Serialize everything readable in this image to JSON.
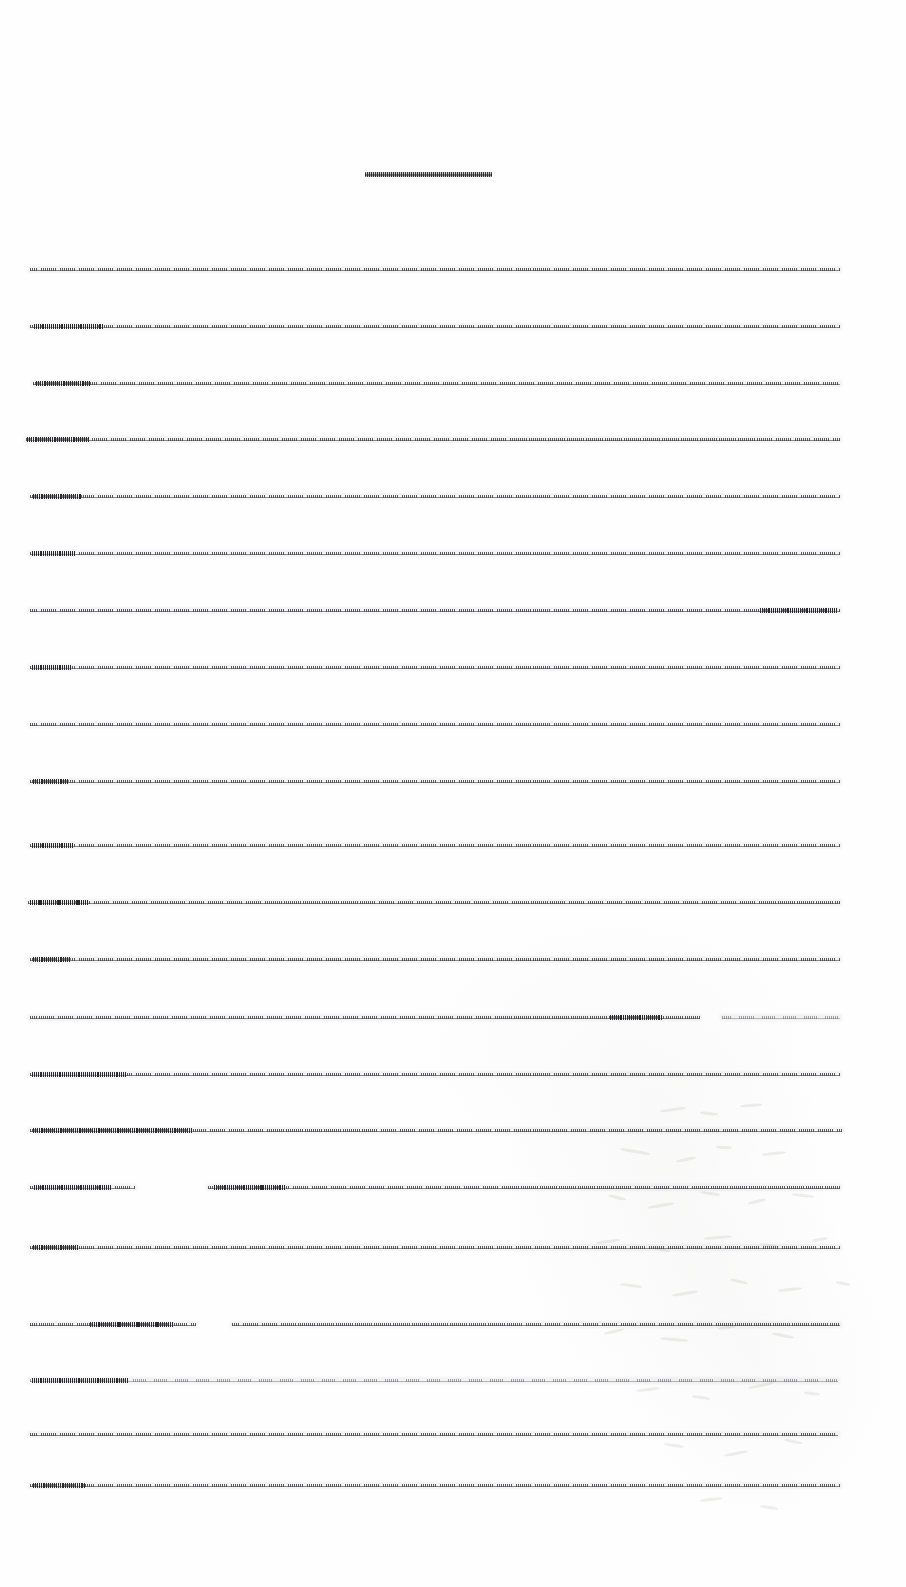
{
  "document": {
    "kind": "scanned-text-page",
    "page_width": 906,
    "page_height": 1587,
    "background_color": "#fefefe",
    "ink_color": "#37373a",
    "legibility": "text is rendered at a scale where individual glyphs are not resolvable; each text line appears as a compressed horizontal stroke",
    "text_block": {
      "left_margin": 30,
      "right_margin": 840,
      "column_width": 810,
      "line_spacing": 57.2,
      "first_line_y": 267,
      "line_count": 23
    }
  },
  "title": {
    "name": "document-title",
    "x": 365,
    "y": 172,
    "width": 127,
    "height": 5,
    "center_x": 428.5,
    "weight": "bold",
    "text": ""
  },
  "lines": [
    {
      "y": 267,
      "segments": [
        {
          "x": 30,
          "w": 810,
          "density": "normal"
        }
      ],
      "bumps": []
    },
    {
      "y": 324,
      "segments": [
        {
          "x": 30,
          "w": 810,
          "density": "normal"
        }
      ],
      "bumps": [
        {
          "x": 34,
          "w": 70
        }
      ]
    },
    {
      "y": 381,
      "segments": [
        {
          "x": 33,
          "w": 807,
          "density": "normal"
        }
      ],
      "bumps": [
        {
          "x": 36,
          "w": 54
        }
      ]
    },
    {
      "y": 437,
      "segments": [
        {
          "x": 26,
          "w": 814,
          "density": "normal"
        }
      ],
      "bumps": [
        {
          "x": 27,
          "w": 62
        }
      ]
    },
    {
      "y": 494,
      "segments": [
        {
          "x": 30,
          "w": 810,
          "density": "normal"
        }
      ],
      "bumps": [
        {
          "x": 33,
          "w": 48
        }
      ]
    },
    {
      "y": 551,
      "segments": [
        {
          "x": 30,
          "w": 810,
          "density": "normal"
        }
      ],
      "bumps": [
        {
          "x": 32,
          "w": 44
        }
      ]
    },
    {
      "y": 608,
      "segments": [
        {
          "x": 30,
          "w": 810,
          "density": "normal"
        }
      ],
      "bumps": [
        {
          "x": 760,
          "w": 78
        }
      ]
    },
    {
      "y": 665,
      "segments": [
        {
          "x": 30,
          "w": 810,
          "density": "normal"
        }
      ],
      "bumps": [
        {
          "x": 32,
          "w": 40
        }
      ]
    },
    {
      "y": 722,
      "segments": [
        {
          "x": 30,
          "w": 810,
          "density": "normal"
        }
      ],
      "bumps": []
    },
    {
      "y": 779,
      "segments": [
        {
          "x": 30,
          "w": 810,
          "density": "normal"
        }
      ],
      "bumps": [
        {
          "x": 33,
          "w": 36
        }
      ]
    },
    {
      "y": 843,
      "segments": [
        {
          "x": 30,
          "w": 810,
          "density": "normal"
        }
      ],
      "bumps": [
        {
          "x": 32,
          "w": 42
        }
      ]
    },
    {
      "y": 900,
      "segments": [
        {
          "x": 28,
          "w": 812,
          "density": "normal"
        }
      ],
      "bumps": [
        {
          "x": 30,
          "w": 58
        }
      ]
    },
    {
      "y": 957,
      "segments": [
        {
          "x": 30,
          "w": 810,
          "density": "normal"
        }
      ],
      "bumps": [
        {
          "x": 33,
          "w": 38
        }
      ]
    },
    {
      "y": 1015,
      "segments": [
        {
          "x": 30,
          "w": 670,
          "density": "normal"
        },
        {
          "x": 722,
          "w": 118,
          "density": "light"
        }
      ],
      "bumps": [
        {
          "x": 610,
          "w": 52
        }
      ]
    },
    {
      "y": 1072,
      "segments": [
        {
          "x": 30,
          "w": 810,
          "density": "normal"
        }
      ],
      "bumps": [
        {
          "x": 32,
          "w": 94
        }
      ]
    },
    {
      "y": 1128,
      "segments": [
        {
          "x": 30,
          "w": 812,
          "density": "normal"
        }
      ],
      "bumps": [
        {
          "x": 33,
          "w": 160
        }
      ]
    },
    {
      "y": 1185,
      "segments": [
        {
          "x": 30,
          "w": 105,
          "density": "normal"
        },
        {
          "x": 208,
          "w": 632,
          "density": "normal"
        }
      ],
      "bumps": [
        {
          "x": 34,
          "w": 78
        },
        {
          "x": 214,
          "w": 72
        }
      ]
    },
    {
      "y": 1245,
      "segments": [
        {
          "x": 30,
          "w": 810,
          "density": "normal"
        }
      ],
      "bumps": [
        {
          "x": 33,
          "w": 46
        }
      ]
    },
    {
      "y": 1322,
      "segments": [
        {
          "x": 30,
          "w": 166,
          "density": "normal"
        },
        {
          "x": 232,
          "w": 608,
          "density": "normal"
        }
      ],
      "bumps": [
        {
          "x": 90,
          "w": 84
        }
      ]
    },
    {
      "y": 1378,
      "segments": [
        {
          "x": 30,
          "w": 808,
          "density": "light"
        }
      ],
      "bumps": [
        {
          "x": 32,
          "w": 96
        }
      ]
    },
    {
      "y": 1432,
      "segments": [
        {
          "x": 30,
          "w": 808,
          "density": "normal"
        }
      ],
      "bumps": []
    },
    {
      "y": 1483,
      "segments": [
        {
          "x": 30,
          "w": 810,
          "density": "normal"
        }
      ],
      "bumps": [
        {
          "x": 33,
          "w": 52
        }
      ]
    }
  ],
  "artifacts": {
    "name": "scan-showthrough",
    "description": "faint ghosted text bleeding through from the reverse side of the sheet, concentrated in the lower-right quadrant",
    "strokes": [
      {
        "x": 660,
        "y": 1108,
        "w": 26,
        "h": 3,
        "r": -8
      },
      {
        "x": 700,
        "y": 1112,
        "w": 18,
        "h": 3,
        "r": 6
      },
      {
        "x": 740,
        "y": 1104,
        "w": 22,
        "h": 3,
        "r": -4
      },
      {
        "x": 620,
        "y": 1150,
        "w": 30,
        "h": 3,
        "r": 10
      },
      {
        "x": 676,
        "y": 1158,
        "w": 20,
        "h": 3,
        "r": -12
      },
      {
        "x": 716,
        "y": 1146,
        "w": 16,
        "h": 3,
        "r": 4
      },
      {
        "x": 762,
        "y": 1152,
        "w": 24,
        "h": 3,
        "r": -6
      },
      {
        "x": 608,
        "y": 1196,
        "w": 18,
        "h": 3,
        "r": 14
      },
      {
        "x": 648,
        "y": 1204,
        "w": 26,
        "h": 3,
        "r": -10
      },
      {
        "x": 700,
        "y": 1192,
        "w": 20,
        "h": 3,
        "r": 8
      },
      {
        "x": 748,
        "y": 1200,
        "w": 18,
        "h": 3,
        "r": -14
      },
      {
        "x": 792,
        "y": 1194,
        "w": 22,
        "h": 3,
        "r": 6
      },
      {
        "x": 596,
        "y": 1240,
        "w": 24,
        "h": 3,
        "r": -8
      },
      {
        "x": 652,
        "y": 1248,
        "w": 18,
        "h": 3,
        "r": 12
      },
      {
        "x": 704,
        "y": 1236,
        "w": 28,
        "h": 3,
        "r": -5
      },
      {
        "x": 760,
        "y": 1244,
        "w": 20,
        "h": 3,
        "r": 9
      },
      {
        "x": 812,
        "y": 1238,
        "w": 16,
        "h": 3,
        "r": -11
      },
      {
        "x": 620,
        "y": 1284,
        "w": 22,
        "h": 3,
        "r": 7
      },
      {
        "x": 672,
        "y": 1292,
        "w": 26,
        "h": 3,
        "r": -9
      },
      {
        "x": 730,
        "y": 1280,
        "w": 18,
        "h": 3,
        "r": 13
      },
      {
        "x": 778,
        "y": 1288,
        "w": 24,
        "h": 3,
        "r": -6
      },
      {
        "x": 836,
        "y": 1282,
        "w": 14,
        "h": 3,
        "r": 10
      },
      {
        "x": 604,
        "y": 1330,
        "w": 20,
        "h": 3,
        "r": -13
      },
      {
        "x": 660,
        "y": 1338,
        "w": 28,
        "h": 3,
        "r": 5
      },
      {
        "x": 718,
        "y": 1326,
        "w": 18,
        "h": 3,
        "r": -8
      },
      {
        "x": 772,
        "y": 1334,
        "w": 22,
        "h": 3,
        "r": 11
      },
      {
        "x": 636,
        "y": 1388,
        "w": 24,
        "h": 3,
        "r": -7
      },
      {
        "x": 692,
        "y": 1396,
        "w": 18,
        "h": 3,
        "r": 9
      },
      {
        "x": 748,
        "y": 1384,
        "w": 26,
        "h": 3,
        "r": -12
      },
      {
        "x": 804,
        "y": 1392,
        "w": 16,
        "h": 3,
        "r": 6
      },
      {
        "x": 664,
        "y": 1444,
        "w": 20,
        "h": 3,
        "r": 8
      },
      {
        "x": 724,
        "y": 1452,
        "w": 24,
        "h": 3,
        "r": -10
      },
      {
        "x": 784,
        "y": 1440,
        "w": 18,
        "h": 3,
        "r": 12
      },
      {
        "x": 700,
        "y": 1498,
        "w": 22,
        "h": 3,
        "r": -6
      },
      {
        "x": 760,
        "y": 1506,
        "w": 18,
        "h": 3,
        "r": 9
      }
    ]
  }
}
